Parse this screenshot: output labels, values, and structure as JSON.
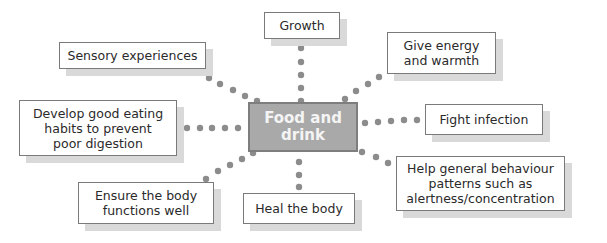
{
  "diagram": {
    "center": {
      "label": "Food and\ndrink",
      "fill": "#a9a9a9",
      "border": "#7e7e7e",
      "text_color": "#f4f4f4"
    },
    "nodes": [
      {
        "id": "growth",
        "label": "Growth"
      },
      {
        "id": "give-energy",
        "label": "Give energy\nand warmth"
      },
      {
        "id": "fight-infection",
        "label": "Fight infection"
      },
      {
        "id": "help-behaviour",
        "label": "Help general behaviour\npatterns such as\nalertness/concentration"
      },
      {
        "id": "heal-body",
        "label": "Heal the body"
      },
      {
        "id": "ensure-body",
        "label": "Ensure the body\nfunctions well"
      },
      {
        "id": "develop-habits",
        "label": "Develop good eating\nhabits to prevent\npoor digestion"
      },
      {
        "id": "sensory",
        "label": "Sensory experiences"
      }
    ],
    "connector_style": "dotted",
    "connector_color": "#8c8c8c",
    "shadow_color": "#d9d9d9"
  }
}
